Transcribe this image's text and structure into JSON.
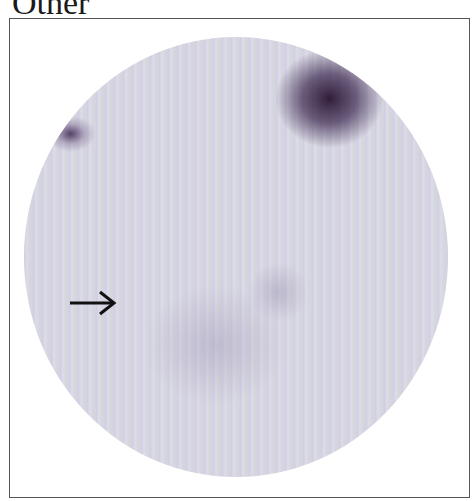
{
  "panel": {
    "label": "Other",
    "annotations": [
      {
        "type": "arrow",
        "direction": "right"
      }
    ]
  }
}
